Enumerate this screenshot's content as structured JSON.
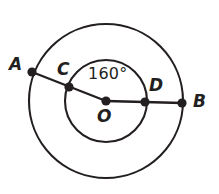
{
  "figure": {
    "type": "concentric-circles-diagram",
    "background_color": "#ffffff",
    "stroke_color": "#231f20",
    "labels": {
      "point_a": "A",
      "point_b": "B",
      "point_c": "C",
      "point_d": "D",
      "center_o": "O",
      "angle": "160°"
    },
    "angle_value": 160,
    "angle_unit": "degrees",
    "geometry": {
      "center": {
        "x": 106,
        "y": 101
      },
      "outer_circle_radius": 77,
      "inner_circle_radius": 41,
      "points": [
        {
          "name": "A",
          "x": 32,
          "y": 72,
          "on": "outer-circle"
        },
        {
          "name": "C",
          "x": 69,
          "y": 87,
          "on": "inner-circle"
        },
        {
          "name": "O",
          "x": 106,
          "y": 101,
          "on": "center"
        },
        {
          "name": "D",
          "x": 145,
          "y": 102,
          "on": "inner-circle"
        },
        {
          "name": "B",
          "x": 182,
          "y": 103,
          "on": "outer-circle"
        }
      ],
      "segments": [
        {
          "from": "A",
          "to": "O"
        },
        {
          "from": "O",
          "to": "B"
        }
      ]
    }
  }
}
